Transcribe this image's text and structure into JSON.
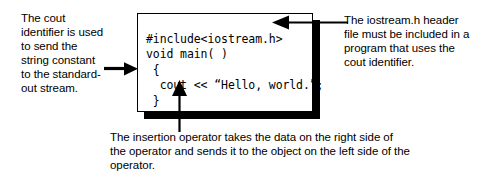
{
  "code_box": {
    "lines": [
      "#include<iostream.h>",
      "void main( )",
      " {",
      "  cout << “Hello, world.”;",
      " }"
    ],
    "text": "#include<iostream.h>\nvoid main( )\n {\n  cout << “Hello, world.”;\n }",
    "border_color": "#000000",
    "shadow_color": "#000000",
    "background_color": "#ffffff"
  },
  "annotations": {
    "left": {
      "text": "The cout identifier is used to send the string constant to the standard-out stream.",
      "target": "cout << “Hello, world.”;"
    },
    "right": {
      "text": "The iostream.h header file must be included in a program that uses the cout identifier.",
      "target": "#include<iostream.h>"
    },
    "bottom": {
      "text": "The insertion operator takes the data on the right side of the operator and sends it to the object on the left side of the operator.",
      "target": "<<"
    }
  },
  "arrows": [
    {
      "name": "left-to-box",
      "direction": "right"
    },
    {
      "name": "box-to-right",
      "direction": "left"
    },
    {
      "name": "up-to-operator",
      "direction": "up"
    }
  ]
}
